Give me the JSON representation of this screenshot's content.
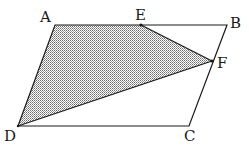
{
  "diagram": {
    "type": "geometry",
    "colors": {
      "stroke": "#1a1a1a",
      "shade_dot": "#6e6e6e",
      "background": "#ffffff"
    },
    "points": {
      "A": {
        "label": "A",
        "x": 55,
        "y": 25,
        "label_x": 40,
        "label_y": 22
      },
      "B": {
        "label": "B",
        "x": 227,
        "y": 25,
        "label_x": 230,
        "label_y": 28
      },
      "C": {
        "label": "C",
        "x": 189,
        "y": 126,
        "label_x": 184,
        "label_y": 141
      },
      "D": {
        "label": "D",
        "x": 18,
        "y": 126,
        "label_x": 4,
        "label_y": 141
      },
      "E": {
        "label": "E",
        "x": 141,
        "y": 25,
        "label_x": 135,
        "label_y": 20
      },
      "F": {
        "label": "F",
        "x": 212,
        "y": 61,
        "label_x": 217,
        "label_y": 68
      }
    },
    "outline": [
      "A",
      "B",
      "C",
      "D"
    ],
    "shaded_region": [
      "A",
      "E",
      "F",
      "D"
    ],
    "segments": [
      [
        "E",
        "F"
      ],
      [
        "F",
        "D"
      ]
    ]
  }
}
